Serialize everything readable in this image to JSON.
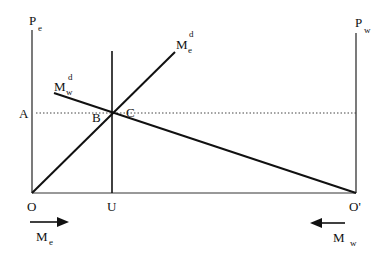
{
  "diagram": {
    "type": "economics-two-sector-labor-market",
    "axes": {
      "left": {
        "label": "P",
        "subscript": "e"
      },
      "right": {
        "label": "P",
        "subscript": "w"
      },
      "origin_left": "O",
      "origin_right": "O'",
      "vertical_marker": "U"
    },
    "curves": {
      "me_demand": {
        "label": "M",
        "subscript": "e",
        "superscript": "d"
      },
      "mw_demand": {
        "label": "M",
        "subscript": "w",
        "superscript": "d"
      }
    },
    "points": {
      "price_level": "A",
      "point_b": "B",
      "point_c": "C"
    },
    "arrows": {
      "left": {
        "direction": "right",
        "label": "M",
        "subscript": "e"
      },
      "right": {
        "direction": "left",
        "label": "M",
        "subscript": "w"
      }
    }
  }
}
